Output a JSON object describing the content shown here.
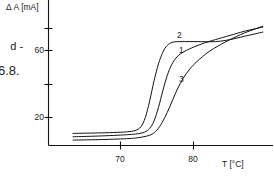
{
  "figure": {
    "caption_fragment_line1": "d -",
    "caption_fragment_line2": "6.8."
  },
  "chart_data": {
    "type": "line",
    "title": "",
    "subtitle": "",
    "xlabel": "T [°C]",
    "ylabel": "Δ A [mA]",
    "xlim": [
      63.5,
      89.5
    ],
    "ylim": [
      -1,
      86
    ],
    "grid": false,
    "legend_position": "inline-annotations",
    "xticks": [
      70,
      80
    ],
    "xtick_labels": [
      "70",
      "80"
    ],
    "yticks": [
      20,
      40,
      60,
      80
    ],
    "ytick_labels": [
      "20",
      "",
      "60",
      ""
    ],
    "annotations": [
      {
        "text": "2",
        "x": 78.0,
        "y": 68.5
      },
      {
        "text": "1",
        "x": 78.3,
        "y": 59.5
      },
      {
        "text": "3",
        "x": 78.3,
        "y": 42.5
      }
    ],
    "series": [
      {
        "name": "1",
        "label": "1",
        "x": [
          63.5,
          66,
          68,
          70,
          71.5,
          72.5,
          73.3,
          74.0,
          74.6,
          75.2,
          75.8,
          76.4,
          77.0,
          77.6,
          78.2,
          79.0,
          80.0,
          81.5,
          83.0,
          85.0,
          87.0,
          89.5
        ],
        "y": [
          8.5,
          8.8,
          9.1,
          9.5,
          9.9,
          10.4,
          11.3,
          13.5,
          18.0,
          26.0,
          36.0,
          45.0,
          51.5,
          55.5,
          58.0,
          60.0,
          62.0,
          64.5,
          66.5,
          69.0,
          71.5,
          74.0
        ]
      },
      {
        "name": "2",
        "label": "2",
        "x": [
          63.5,
          66,
          68,
          70,
          71.0,
          72.0,
          72.8,
          73.4,
          74.0,
          74.6,
          75.2,
          75.8,
          76.4,
          77.2,
          78.5,
          80.5,
          83.0,
          85.0,
          87.0,
          89.5
        ],
        "y": [
          10.5,
          10.7,
          10.9,
          11.2,
          11.5,
          12.2,
          14.5,
          20.0,
          30.0,
          42.0,
          52.0,
          59.0,
          63.0,
          65.0,
          65.3,
          65.3,
          65.3,
          66.5,
          68.5,
          71.0
        ]
      },
      {
        "name": "3",
        "label": "3",
        "x": [
          63.5,
          66,
          68,
          70,
          71.5,
          72.5,
          73.5,
          74.3,
          75.0,
          75.7,
          76.4,
          77.1,
          77.8,
          78.6,
          79.5,
          80.5,
          82.0,
          83.5,
          85.0,
          87.0,
          89.5
        ],
        "y": [
          6.5,
          6.7,
          6.9,
          7.2,
          7.5,
          8.0,
          8.8,
          10.0,
          12.5,
          17.0,
          23.0,
          30.0,
          37.0,
          43.5,
          49.0,
          53.5,
          59.0,
          63.0,
          66.5,
          70.5,
          74.5
        ]
      }
    ]
  }
}
